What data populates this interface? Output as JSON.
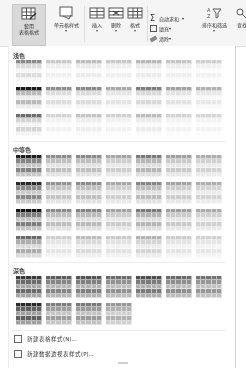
{
  "ribbon": {
    "buttons": [
      {
        "id": "format-as-table",
        "label": "套用\n表格格式",
        "chevron": "▾",
        "selected": true,
        "icon": "table-style-icon"
      },
      {
        "id": "cell-styles",
        "label": "单元格样式",
        "chevron": "▾",
        "selected": false,
        "icon": "cell-styles-icon"
      },
      {
        "id": "insert",
        "label": "插入",
        "chevron": "▾",
        "selected": false,
        "icon": "insert-cells-icon"
      },
      {
        "id": "delete",
        "label": "删除",
        "chevron": "▾",
        "selected": false,
        "icon": "delete-cells-icon"
      },
      {
        "id": "format",
        "label": "格式",
        "chevron": "▾",
        "selected": false,
        "icon": "format-cells-icon"
      }
    ],
    "editing": {
      "autosum": {
        "label": "自动求和",
        "chevron": "▾",
        "icon": "sigma-icon"
      },
      "fill": {
        "label": "填充",
        "chevron": "▾",
        "icon": "fill-icon"
      },
      "clear": {
        "label": "清除",
        "chevron": "▾",
        "icon": "eraser-icon"
      },
      "sort_filter": {
        "label": "排序和筛选",
        "chevron": "▾",
        "icon": "sort-filter-icon"
      },
      "find": {
        "label": "查找",
        "icon": "find-icon"
      }
    }
  },
  "gallery": {
    "sections": [
      {
        "id": "light",
        "label": "浅色",
        "rows": 3
      },
      {
        "id": "medium",
        "label": "中等色",
        "rows": 4
      },
      {
        "id": "dark",
        "label": "深色",
        "rows": 2
      }
    ],
    "light": [
      [
        "#8a8a8a",
        "#c9c9c9",
        "#bdbdbd",
        "#c8c8c8",
        "#b8b8b8",
        "#c5c5c5",
        "#cfcfcf"
      ],
      [
        "#1a1a1a",
        "#8f8f8f",
        "#8a8a8a",
        "#a9a9a9",
        "#7f7f7f",
        "#a3a3a3",
        "#b1b1b1"
      ],
      [
        "#6e6e6e",
        "#d4d4d4",
        "#c4c4c4",
        "#d0d0d0",
        "#bcbcbc",
        "#d2d2d2",
        "#d6d6d6"
      ]
    ],
    "medium": [
      [
        "#1f1f1f",
        "#8d8d8d",
        "#8a8a8a",
        "#a6a6a6",
        "#7b7b7b",
        "#a0a0a0",
        "#aeaeae"
      ],
      [
        "#2a2a2a",
        "#939393",
        "#8c8c8c",
        "#a8a8a8",
        "#858585",
        "#a4a4a4",
        "#b0b0b0"
      ],
      [
        "#151515",
        "#8a8a8a",
        "#848484",
        "#a3a3a3",
        "#7a7a7a",
        "#9f9f9f",
        "#ababab"
      ],
      [
        "#6a6a6a",
        "#cfcfcf",
        "#bdbdbd",
        "#cacaca",
        "#b3b3b3",
        "#cdcdcd",
        "#d2d2d2"
      ]
    ],
    "dark": [
      [
        "#3a3a3a",
        "#5e5e5e",
        "#555555",
        "#6d6d6d",
        "#4e4e4e",
        "#6a6a6a",
        "#747474"
      ],
      [
        "#2b2b2b",
        "#7e7e7e",
        "#7a7a7a",
        "#979797"
      ]
    ]
  },
  "menu": {
    "items": [
      {
        "label": "新建表格样式(N)...",
        "icon": "new-table-style-icon"
      },
      {
        "label": "新建数据透视表样式(P)...",
        "icon": "new-pivot-style-icon"
      }
    ]
  }
}
